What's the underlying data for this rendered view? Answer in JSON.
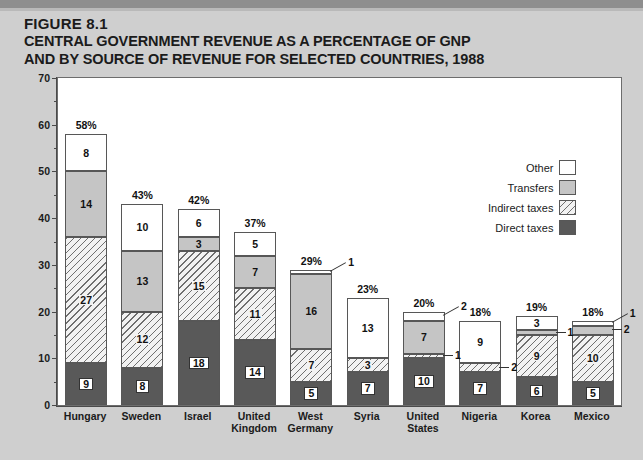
{
  "figure": {
    "number": "FIGURE 8.1",
    "title_line1": "CENTRAL GOVERNMENT REVENUE AS A PERCENTAGE OF GNP",
    "title_line2": "AND BY SOURCE OF REVENUE FOR SELECTED COUNTRIES, 1988",
    "footnote": ""
  },
  "legend": {
    "items": [
      {
        "label": "Other",
        "swatch": "white-square-icon",
        "color": "#ffffff"
      },
      {
        "label": "Transfers",
        "swatch": "gray-square-icon",
        "color": "#c5c5c5"
      },
      {
        "label": "Indirect taxes",
        "swatch": "hatched-square-icon",
        "color": "#f2f2f2"
      },
      {
        "label": "Direct taxes",
        "swatch": "dark-square-icon",
        "color": "#595959"
      }
    ]
  },
  "chart_data": {
    "type": "bar",
    "subtype": "stacked",
    "title": "CENTRAL GOVERNMENT REVENUE AS A PERCENTAGE OF GNP AND BY SOURCE OF REVENUE FOR SELECTED COUNTRIES, 1988",
    "xlabel": "",
    "ylabel": "PERCENTAGE",
    "ylim": [
      0,
      70
    ],
    "ytick_labels": [
      "0",
      "10",
      "20",
      "30",
      "40",
      "50",
      "60",
      "70"
    ],
    "ytick_values": [
      0,
      10,
      20,
      30,
      40,
      50,
      60,
      70
    ],
    "minor_tick_interval": 5,
    "grid": false,
    "legend_position": "top-right",
    "categories": [
      "Hungary",
      "Sweden",
      "Israel",
      "United Kingdom",
      "West Germany",
      "Syria",
      "United States",
      "Nigeria",
      "Korea",
      "Mexico"
    ],
    "category_label_lines": [
      [
        "Hungary"
      ],
      [
        "Sweden"
      ],
      [
        "Israel"
      ],
      [
        "United",
        "Kingdom"
      ],
      [
        "West",
        "Germany"
      ],
      [
        "Syria"
      ],
      [
        "United",
        "States"
      ],
      [
        "Nigeria"
      ],
      [
        "Korea"
      ],
      [
        "Mexico"
      ]
    ],
    "series": [
      {
        "name": "Direct taxes",
        "values": [
          9,
          8,
          18,
          14,
          5,
          7,
          10,
          7,
          6,
          5
        ]
      },
      {
        "name": "Indirect taxes",
        "values": [
          27,
          12,
          15,
          11,
          7,
          3,
          1,
          2,
          9,
          10
        ]
      },
      {
        "name": "Transfers",
        "values": [
          14,
          13,
          3,
          7,
          16,
          0,
          7,
          0,
          1,
          2
        ]
      },
      {
        "name": "Other",
        "values": [
          8,
          10,
          6,
          5,
          1,
          13,
          2,
          9,
          3,
          1
        ]
      }
    ],
    "totals": [
      58,
      43,
      42,
      37,
      29,
      23,
      20,
      18,
      19,
      18
    ],
    "total_labels": [
      "58%",
      "43%",
      "42%",
      "37%",
      "29%",
      "23%",
      "20%",
      "18%",
      "19%",
      "18%"
    ]
  },
  "bars": [
    {
      "country": "Hungary",
      "total_label": "58%",
      "segments": [
        {
          "series": "Direct taxes",
          "value": 9,
          "label": "9",
          "boxed": true,
          "callout": false
        },
        {
          "series": "Indirect taxes",
          "value": 27,
          "label": "27",
          "boxed": false,
          "callout": false
        },
        {
          "series": "Transfers",
          "value": 14,
          "label": "14",
          "boxed": false,
          "callout": false
        },
        {
          "series": "Other",
          "value": 8,
          "label": "8",
          "boxed": false,
          "callout": false
        }
      ]
    },
    {
      "country": "Sweden",
      "total_label": "43%",
      "segments": [
        {
          "series": "Direct taxes",
          "value": 8,
          "label": "8",
          "boxed": true,
          "callout": false
        },
        {
          "series": "Indirect taxes",
          "value": 12,
          "label": "12",
          "boxed": false,
          "callout": false
        },
        {
          "series": "Transfers",
          "value": 13,
          "label": "13",
          "boxed": false,
          "callout": false
        },
        {
          "series": "Other",
          "value": 10,
          "label": "10",
          "boxed": false,
          "callout": false
        }
      ]
    },
    {
      "country": "Israel",
      "total_label": "42%",
      "segments": [
        {
          "series": "Direct taxes",
          "value": 18,
          "label": "18",
          "boxed": true,
          "callout": false
        },
        {
          "series": "Indirect taxes",
          "value": 15,
          "label": "15",
          "boxed": false,
          "callout": false
        },
        {
          "series": "Transfers",
          "value": 3,
          "label": "3",
          "boxed": false,
          "callout": false
        },
        {
          "series": "Other",
          "value": 6,
          "label": "6",
          "boxed": false,
          "callout": false
        }
      ]
    },
    {
      "country": "United Kingdom",
      "total_label": "37%",
      "segments": [
        {
          "series": "Direct taxes",
          "value": 14,
          "label": "14",
          "boxed": true,
          "callout": false
        },
        {
          "series": "Indirect taxes",
          "value": 11,
          "label": "11",
          "boxed": false,
          "callout": false
        },
        {
          "series": "Transfers",
          "value": 7,
          "label": "7",
          "boxed": false,
          "callout": false
        },
        {
          "series": "Other",
          "value": 5,
          "label": "5",
          "boxed": false,
          "callout": false
        }
      ]
    },
    {
      "country": "West Germany",
      "total_label": "29%",
      "segments": [
        {
          "series": "Direct taxes",
          "value": 5,
          "label": "5",
          "boxed": true,
          "callout": false
        },
        {
          "series": "Indirect taxes",
          "value": 7,
          "label": "7",
          "boxed": false,
          "callout": false
        },
        {
          "series": "Transfers",
          "value": 16,
          "label": "16",
          "boxed": false,
          "callout": false
        },
        {
          "series": "Other",
          "value": 1,
          "label": "1",
          "boxed": false,
          "callout": true
        }
      ]
    },
    {
      "country": "Syria",
      "total_label": "23%",
      "segments": [
        {
          "series": "Direct taxes",
          "value": 7,
          "label": "7",
          "boxed": true,
          "callout": false
        },
        {
          "series": "Indirect taxes",
          "value": 3,
          "label": "3",
          "boxed": false,
          "callout": false
        },
        {
          "series": "Other",
          "value": 13,
          "label": "13",
          "boxed": false,
          "callout": false
        }
      ]
    },
    {
      "country": "United States",
      "total_label": "20%",
      "segments": [
        {
          "series": "Direct taxes",
          "value": 10,
          "label": "10",
          "boxed": true,
          "callout": false
        },
        {
          "series": "Indirect taxes",
          "value": 1,
          "label": "1",
          "boxed": false,
          "callout": true
        },
        {
          "series": "Transfers",
          "value": 7,
          "label": "7",
          "boxed": false,
          "callout": false
        },
        {
          "series": "Other",
          "value": 2,
          "label": "2",
          "boxed": false,
          "callout": true
        }
      ]
    },
    {
      "country": "Nigeria",
      "total_label": "18%",
      "segments": [
        {
          "series": "Direct taxes",
          "value": 7,
          "label": "7",
          "boxed": true,
          "callout": false
        },
        {
          "series": "Indirect taxes",
          "value": 2,
          "label": "2",
          "boxed": false,
          "callout": true
        },
        {
          "series": "Other",
          "value": 9,
          "label": "9",
          "boxed": false,
          "callout": false
        }
      ]
    },
    {
      "country": "Korea",
      "total_label": "19%",
      "segments": [
        {
          "series": "Direct taxes",
          "value": 6,
          "label": "6",
          "boxed": true,
          "callout": false
        },
        {
          "series": "Indirect taxes",
          "value": 9,
          "label": "9",
          "boxed": false,
          "callout": false
        },
        {
          "series": "Transfers",
          "value": 1,
          "label": "1",
          "boxed": false,
          "callout": true
        },
        {
          "series": "Other",
          "value": 3,
          "label": "3",
          "boxed": false,
          "callout": false
        }
      ]
    },
    {
      "country": "Mexico",
      "total_label": "18%",
      "segments": [
        {
          "series": "Direct taxes",
          "value": 5,
          "label": "5",
          "boxed": true,
          "callout": false
        },
        {
          "series": "Indirect taxes",
          "value": 10,
          "label": "10",
          "boxed": false,
          "callout": false
        },
        {
          "series": "Transfers",
          "value": 2,
          "label": "2",
          "boxed": false,
          "callout": true
        },
        {
          "series": "Other",
          "value": 1,
          "label": "1",
          "boxed": false,
          "callout": true
        }
      ]
    }
  ]
}
